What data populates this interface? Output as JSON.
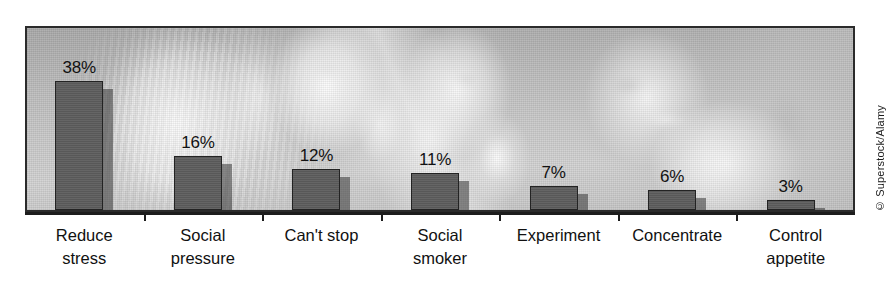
{
  "credit": "© Superstock/Alamy",
  "chart_data": {
    "type": "bar",
    "title": "",
    "subtitle": "",
    "xlabel": "",
    "ylabel": "",
    "ylim": [
      0,
      38
    ],
    "grid": false,
    "legend": "none",
    "orientation": "vertical",
    "value_suffix": "%",
    "background": "grayscale photograph of people smoking",
    "categories": [
      "Reduce stress",
      "Social pressure",
      "Can't stop",
      "Social smoker",
      "Experiment",
      "Concentrate",
      "Control appetite"
    ],
    "category_lines": [
      [
        "Reduce",
        "stress"
      ],
      [
        "Social",
        "pressure"
      ],
      [
        "Can't stop",
        ""
      ],
      [
        "Social",
        "smoker"
      ],
      [
        "Experiment",
        ""
      ],
      [
        "Concentrate",
        ""
      ],
      [
        "Control",
        "appetite"
      ]
    ],
    "values": [
      38,
      16,
      12,
      11,
      7,
      6,
      3
    ],
    "value_labels": [
      "38%",
      "16%",
      "12%",
      "11%",
      "7%",
      "6%",
      "3%"
    ]
  },
  "style": {
    "bar_fill": "#5d5d5d",
    "bar_outline": "#232323",
    "bar_shadow": "rgba(55,55,55,0.55)",
    "axis_color": "#1d1d1d",
    "frame_color": "#2b2b2b",
    "text_color": "#111111",
    "plot_bg": "#b9b9b9"
  }
}
